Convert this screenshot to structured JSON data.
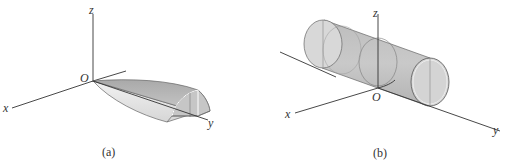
{
  "figure": {
    "panels": [
      {
        "id": "a",
        "caption": "(a)",
        "axes": {
          "x": "x",
          "y": "y",
          "z": "z",
          "origin": "O"
        },
        "solid": "half-paraboloid wedge along y-axis"
      },
      {
        "id": "b",
        "caption": "(b)",
        "axes": {
          "x": "x",
          "y": "y",
          "z": "z",
          "origin": "O"
        },
        "solid": "cylinder along y-axis centered at origin"
      }
    ],
    "colors": {
      "fill_dark": "#b8b8b8",
      "fill_mid": "#cfcfcf",
      "fill_light": "#e4e4e4",
      "axis": "#333333"
    }
  }
}
